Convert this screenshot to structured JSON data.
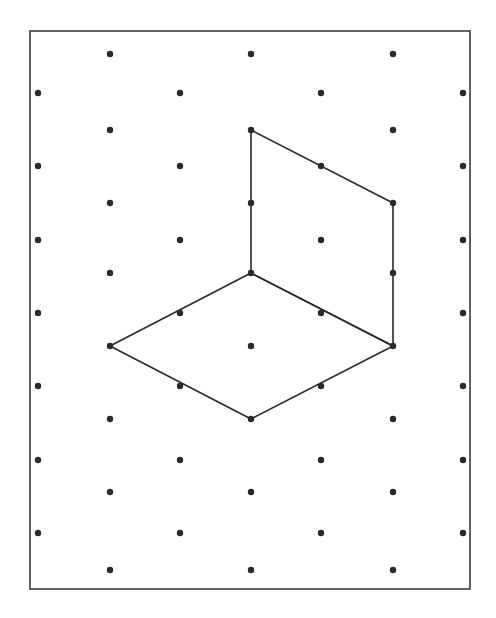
{
  "diagram": {
    "type": "isometric-dot-grid",
    "colors": {
      "background": "#ffffff",
      "frame": "#3a3a3a",
      "dot": "#2a2a2a",
      "line": "#2a2a2a"
    },
    "frame": {
      "x": 30,
      "y": 31,
      "width": 440,
      "height": 558,
      "stroke_width": 1.6
    },
    "dot_radius": 3.2,
    "line_width": 1.6,
    "grid": {
      "column_set_a": {
        "x": [
          110,
          251,
          393
        ],
        "y": [
          54,
          130,
          203,
          273,
          346,
          419,
          492,
          570
        ]
      },
      "column_set_b": {
        "x": [
          38,
          180,
          321,
          463
        ],
        "y": [
          93,
          166,
          240,
          313,
          386,
          460,
          533
        ]
      }
    },
    "shapes": [
      {
        "name": "rhombus-horizontal-face",
        "points": [
          [
            251,
            273
          ],
          [
            393,
            346
          ],
          [
            251,
            419
          ],
          [
            110,
            346
          ]
        ]
      },
      {
        "name": "vertical-face-parallelogram",
        "points": [
          [
            251,
            130
          ],
          [
            393,
            203
          ],
          [
            393,
            346
          ],
          [
            251,
            273
          ]
        ]
      }
    ]
  }
}
